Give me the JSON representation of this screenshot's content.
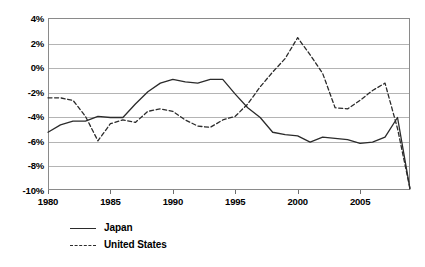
{
  "chart_data": {
    "type": "line",
    "title": "",
    "subtitle": "",
    "xlabel": "",
    "ylabel": "",
    "xlim": [
      1980,
      2009
    ],
    "ylim": [
      -10,
      4
    ],
    "grid": true,
    "legend_position": "below-left",
    "y_ticks": [
      "4%",
      "2%",
      "0%",
      "-2%",
      "-4%",
      "-6%",
      "-8%",
      "-10%"
    ],
    "y_tick_values": [
      4,
      2,
      0,
      -2,
      -4,
      -6,
      -8,
      -10
    ],
    "x_ticks": [
      "1980",
      "1985",
      "1990",
      "1995",
      "2000",
      "2005"
    ],
    "x_tick_values": [
      1980,
      1985,
      1990,
      1995,
      2000,
      2005
    ],
    "x": [
      1980,
      1981,
      1982,
      1983,
      1984,
      1985,
      1986,
      1987,
      1988,
      1989,
      1990,
      1991,
      1992,
      1993,
      1994,
      1995,
      1996,
      1997,
      1998,
      1999,
      2000,
      2001,
      2002,
      2003,
      2004,
      2005,
      2006,
      2007,
      2008,
      2009
    ],
    "series": [
      {
        "name": "Japan",
        "style": "solid",
        "color": "#2b2b2b",
        "values": [
          -5.3,
          -4.7,
          -4.4,
          -4.4,
          -4.0,
          -4.1,
          -4.1,
          -3.0,
          -2.0,
          -1.3,
          -1.0,
          -1.2,
          -1.3,
          -1.0,
          -1.0,
          -2.2,
          -3.3,
          -4.1,
          -5.3,
          -5.5,
          -5.6,
          -6.1,
          -5.7,
          -5.8,
          -5.9,
          -6.2,
          -6.1,
          -5.7,
          -4.1,
          -9.9
        ]
      },
      {
        "name": "United States",
        "style": "dashed",
        "color": "#2b2b2b",
        "values": [
          -2.5,
          -2.5,
          -2.7,
          -4.0,
          -6.0,
          -4.6,
          -4.3,
          -4.5,
          -3.6,
          -3.4,
          -3.6,
          -4.3,
          -4.8,
          -4.9,
          -4.3,
          -4.0,
          -3.0,
          -1.6,
          -0.4,
          0.7,
          2.4,
          1.0,
          -0.5,
          -3.3,
          -3.4,
          -2.7,
          -1.9,
          -1.3,
          -5.0,
          -9.9
        ]
      }
    ]
  },
  "legend": {
    "items": [
      {
        "label": "Japan",
        "style": "solid"
      },
      {
        "label": "United States",
        "style": "dashed"
      }
    ]
  }
}
